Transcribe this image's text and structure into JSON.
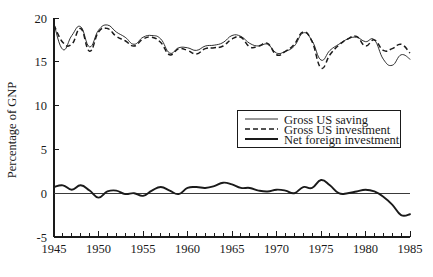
{
  "chart_data": {
    "type": "line",
    "title": "",
    "xlabel": "",
    "ylabel": "Percentage of GNP",
    "xlim": [
      1945,
      1985
    ],
    "ylim": [
      -5,
      20
    ],
    "grid": false,
    "legend_position": "center-right",
    "x_tick_labels": [
      "1945",
      "1950",
      "1955",
      "1960",
      "1965",
      "1970",
      "1975",
      "1980",
      "1985"
    ],
    "x_tick_values": [
      1945,
      1950,
      1955,
      1960,
      1965,
      1970,
      1975,
      1980,
      1985
    ],
    "x_minor_tick_interval": 1,
    "y_tick_labels": [
      "20",
      "15",
      "10",
      "5",
      "0",
      "-5"
    ],
    "y_tick_values": [
      20,
      15,
      10,
      5,
      0,
      -5
    ],
    "x": [
      1945,
      1946,
      1947,
      1948,
      1949,
      1950,
      1951,
      1952,
      1953,
      1954,
      1955,
      1956,
      1957,
      1958,
      1959,
      1960,
      1961,
      1962,
      1963,
      1964,
      1965,
      1966,
      1967,
      1968,
      1969,
      1970,
      1971,
      1972,
      1973,
      1974,
      1975,
      1976,
      1977,
      1978,
      1979,
      1980,
      1981,
      1982,
      1983,
      1984,
      1985
    ],
    "series": [
      {
        "name": "Gross US saving",
        "style": "solid-thin",
        "values": [
          19.3,
          16.4,
          18.0,
          19.0,
          16.7,
          18.6,
          19.2,
          18.4,
          17.8,
          17.0,
          17.8,
          18.0,
          17.6,
          16.0,
          16.6,
          16.6,
          16.3,
          16.8,
          16.9,
          17.2,
          18.0,
          17.9,
          17.1,
          16.8,
          17.0,
          16.0,
          16.2,
          16.8,
          18.3,
          17.4,
          15.2,
          16.3,
          17.0,
          17.6,
          17.8,
          17.3,
          17.5,
          15.3,
          14.6,
          15.8,
          15.3
        ]
      },
      {
        "name": "Gross US investment",
        "style": "dashed",
        "values": [
          19.2,
          17.2,
          17.0,
          18.8,
          16.2,
          18.4,
          18.8,
          17.9,
          17.4,
          16.8,
          17.6,
          17.8,
          17.2,
          15.8,
          16.5,
          16.3,
          15.9,
          16.5,
          16.6,
          16.8,
          17.6,
          17.8,
          16.7,
          16.8,
          17.1,
          15.8,
          16.2,
          17.0,
          18.4,
          17.3,
          14.3,
          15.8,
          16.9,
          17.6,
          17.9,
          16.8,
          17.5,
          16.3,
          16.5,
          17.0,
          16.0
        ]
      },
      {
        "name": "Net foreign investment",
        "style": "solid-thick",
        "values": [
          0.7,
          0.9,
          0.4,
          0.9,
          0.3,
          -0.5,
          0.2,
          0.3,
          -0.1,
          0.0,
          -0.3,
          0.3,
          0.7,
          0.3,
          -0.1,
          0.6,
          0.7,
          0.6,
          0.8,
          1.2,
          1.0,
          0.6,
          0.6,
          0.3,
          0.2,
          0.4,
          0.3,
          0.0,
          0.7,
          0.6,
          1.5,
          0.9,
          0.0,
          0.0,
          0.2,
          0.4,
          0.2,
          -0.4,
          -1.3,
          -2.5,
          -2.4
        ]
      }
    ]
  },
  "legend": {
    "items": [
      {
        "label": "Gross US saving",
        "style": "solid-thin"
      },
      {
        "label": "Gross US investment",
        "style": "dashed"
      },
      {
        "label": "Net foreign investment",
        "style": "solid-thick"
      }
    ]
  }
}
